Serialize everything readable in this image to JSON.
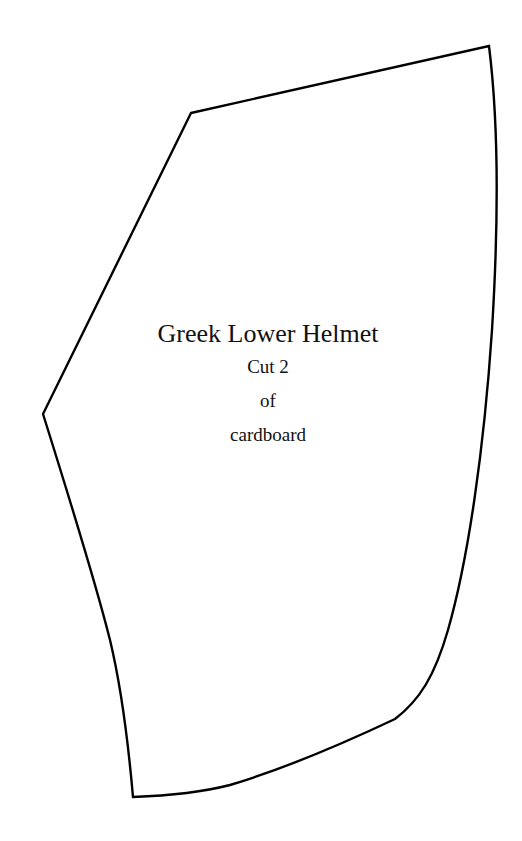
{
  "pattern": {
    "title": "Greek Lower Helmet",
    "instructions": [
      "Cut 2",
      "of",
      "cardboard"
    ],
    "outline_color": "#000000",
    "background_color": "#ffffff"
  }
}
